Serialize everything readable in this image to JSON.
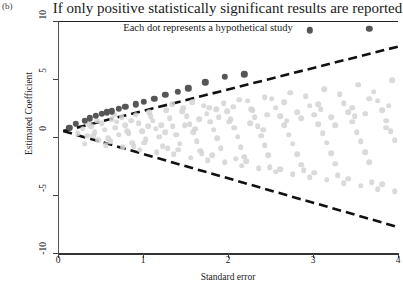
{
  "panel": {
    "label": "(b)"
  },
  "title": "If only positive statistically significant results are reported",
  "annotation": "Each dot represents a hypothetical study",
  "colors": {
    "reported_dot": "#565656",
    "unreported_dot": "#d4d4d4",
    "funnel_line": "#111111",
    "axis": "#333333",
    "background": "#ffffff"
  },
  "chart_data": {
    "type": "scatter",
    "title": "If only positive statistically significant results are reported",
    "subtitle": "Each dot represents a hypothetical study",
    "xlabel": "Standard error",
    "ylabel": "Estimated Coefficient",
    "xlim": [
      0,
      4
    ],
    "ylim": [
      -10,
      10
    ],
    "xticks": [
      0,
      1,
      2,
      3,
      4
    ],
    "yticks": [
      10,
      5,
      0,
      -5,
      -10
    ],
    "xticklabels": [
      "0",
      "1",
      "2",
      "3",
      "4"
    ],
    "yticklabels": [
      "10",
      "5",
      "0",
      "-5",
      "-10"
    ],
    "grid": false,
    "legend": "none",
    "annotations": [
      {
        "text": "Each dot represents a hypothetical study",
        "x": 1.55,
        "y": 9.4
      }
    ],
    "funnel_lines": [
      {
        "name": "upper significance boundary",
        "style": "dashed",
        "x": [
          0.05,
          4.0
        ],
        "y": [
          0.6,
          7.9
        ]
      },
      {
        "name": "lower significance boundary",
        "style": "dashed",
        "x": [
          0.05,
          4.0
        ],
        "y": [
          0.6,
          -7.7
        ]
      }
    ],
    "series": [
      {
        "name": "Reported studies (positive and statistically significant)",
        "color": "#565656",
        "marker": "circle",
        "points": [
          [
            0.12,
            0.9
          ],
          [
            0.2,
            1.2
          ],
          [
            0.3,
            1.5
          ],
          [
            0.36,
            1.7
          ],
          [
            0.43,
            1.9
          ],
          [
            0.5,
            2.1
          ],
          [
            0.56,
            2.2
          ],
          [
            0.62,
            2.3
          ],
          [
            0.7,
            2.5
          ],
          [
            0.78,
            2.7
          ],
          [
            0.9,
            2.9
          ],
          [
            1.0,
            3.1
          ],
          [
            1.12,
            3.4
          ],
          [
            1.25,
            3.7
          ],
          [
            1.4,
            4.0
          ],
          [
            1.52,
            4.3
          ],
          [
            1.72,
            4.8
          ],
          [
            1.95,
            5.3
          ],
          [
            2.18,
            5.5
          ],
          [
            2.95,
            9.3
          ],
          [
            3.65,
            9.4
          ]
        ]
      },
      {
        "name": "Unreported studies (null or negative results)",
        "color": "#d4d4d4",
        "marker": "circle",
        "points": [
          [
            0.22,
            0.4
          ],
          [
            0.28,
            0.8
          ],
          [
            0.33,
            0.2
          ],
          [
            0.38,
            1.0
          ],
          [
            0.42,
            0.5
          ],
          [
            0.46,
            -0.2
          ],
          [
            0.5,
            1.3
          ],
          [
            0.54,
            0.7
          ],
          [
            0.58,
            0.0
          ],
          [
            0.62,
            1.6
          ],
          [
            0.66,
            0.9
          ],
          [
            0.7,
            0.3
          ],
          [
            0.74,
            1.8
          ],
          [
            0.78,
            1.1
          ],
          [
            0.82,
            0.4
          ],
          [
            0.86,
            -0.4
          ],
          [
            0.9,
            2.0
          ],
          [
            0.94,
            1.3
          ],
          [
            0.98,
            0.6
          ],
          [
            1.02,
            -0.1
          ],
          [
            1.06,
            2.2
          ],
          [
            1.1,
            1.5
          ],
          [
            1.14,
            0.8
          ],
          [
            1.18,
            0.1
          ],
          [
            1.22,
            -0.7
          ],
          [
            1.26,
            2.4
          ],
          [
            1.3,
            1.7
          ],
          [
            1.34,
            1.0
          ],
          [
            1.38,
            0.3
          ],
          [
            1.42,
            -0.5
          ],
          [
            1.46,
            2.6
          ],
          [
            1.5,
            1.9
          ],
          [
            1.54,
            1.2
          ],
          [
            1.58,
            0.5
          ],
          [
            1.62,
            -0.3
          ],
          [
            1.66,
            -1.1
          ],
          [
            1.7,
            2.8
          ],
          [
            1.74,
            2.1
          ],
          [
            1.78,
            1.4
          ],
          [
            1.82,
            0.7
          ],
          [
            1.86,
            0.0
          ],
          [
            1.9,
            -0.9
          ],
          [
            1.94,
            3.0
          ],
          [
            1.98,
            2.3
          ],
          [
            2.02,
            1.6
          ],
          [
            2.06,
            0.9
          ],
          [
            2.1,
            0.1
          ],
          [
            2.14,
            -0.8
          ],
          [
            2.18,
            -1.6
          ],
          [
            2.22,
            3.2
          ],
          [
            2.26,
            2.5
          ],
          [
            2.3,
            1.8
          ],
          [
            2.34,
            1.0
          ],
          [
            2.38,
            0.2
          ],
          [
            2.42,
            -0.6
          ],
          [
            2.46,
            -1.5
          ],
          [
            2.5,
            3.4
          ],
          [
            2.55,
            2.6
          ],
          [
            2.6,
            1.9
          ],
          [
            2.65,
            1.1
          ],
          [
            2.7,
            0.3
          ],
          [
            2.75,
            -0.5
          ],
          [
            2.8,
            -1.4
          ],
          [
            2.85,
            -2.3
          ],
          [
            2.9,
            3.6
          ],
          [
            2.95,
            2.8
          ],
          [
            3.0,
            2.0
          ],
          [
            3.05,
            1.2
          ],
          [
            3.1,
            0.4
          ],
          [
            3.15,
            -0.4
          ],
          [
            3.2,
            -1.3
          ],
          [
            3.25,
            -2.2
          ],
          [
            3.3,
            3.8
          ],
          [
            3.35,
            3.0
          ],
          [
            3.4,
            2.2
          ],
          [
            3.45,
            1.4
          ],
          [
            3.5,
            0.5
          ],
          [
            3.55,
            -0.3
          ],
          [
            3.6,
            -1.2
          ],
          [
            3.65,
            -2.1
          ],
          [
            3.7,
            4.0
          ],
          [
            3.75,
            3.2
          ],
          [
            3.8,
            2.4
          ],
          [
            3.85,
            1.5
          ],
          [
            3.9,
            0.6
          ],
          [
            3.95,
            -0.2
          ],
          [
            0.45,
            1.5
          ],
          [
            0.55,
            -0.6
          ],
          [
            0.65,
            2.0
          ],
          [
            0.75,
            -0.8
          ],
          [
            0.85,
            1.5
          ],
          [
            0.95,
            -1.0
          ],
          [
            1.05,
            1.0
          ],
          [
            1.15,
            -1.2
          ],
          [
            1.25,
            0.5
          ],
          [
            1.35,
            -1.4
          ],
          [
            1.45,
            2.3
          ],
          [
            1.55,
            -1.7
          ],
          [
            1.65,
            1.6
          ],
          [
            1.75,
            -1.9
          ],
          [
            1.85,
            2.5
          ],
          [
            1.95,
            -2.1
          ],
          [
            2.05,
            2.7
          ],
          [
            2.15,
            -2.4
          ],
          [
            2.25,
            1.3
          ],
          [
            2.35,
            -2.6
          ],
          [
            2.45,
            2.0
          ],
          [
            2.55,
            -2.9
          ],
          [
            2.65,
            3.1
          ],
          [
            2.75,
            -3.1
          ],
          [
            2.85,
            1.7
          ],
          [
            2.95,
            -3.4
          ],
          [
            3.05,
            2.9
          ],
          [
            3.15,
            -3.6
          ],
          [
            3.25,
            1.1
          ],
          [
            3.35,
            -3.9
          ],
          [
            3.45,
            2.6
          ],
          [
            3.55,
            -4.1
          ],
          [
            3.65,
            3.4
          ],
          [
            3.75,
            -4.4
          ],
          [
            3.85,
            0.9
          ],
          [
            3.95,
            -4.6
          ],
          [
            0.3,
            -0.5
          ],
          [
            0.4,
            0.2
          ],
          [
            0.6,
            -0.3
          ],
          [
            0.8,
            0.6
          ],
          [
            1.0,
            -0.4
          ],
          [
            1.2,
            1.1
          ],
          [
            1.4,
            -1.0
          ],
          [
            1.6,
            0.8
          ],
          [
            1.8,
            -1.5
          ],
          [
            2.0,
            1.4
          ],
          [
            2.2,
            -2.0
          ],
          [
            2.4,
            0.7
          ],
          [
            2.6,
            -2.7
          ],
          [
            2.8,
            2.2
          ],
          [
            3.0,
            -3.0
          ],
          [
            3.2,
            1.8
          ],
          [
            3.4,
            -3.5
          ],
          [
            3.6,
            2.1
          ],
          [
            3.8,
            -4.0
          ],
          [
            0.35,
            1.2
          ],
          [
            0.68,
            1.4
          ],
          [
            0.88,
            -0.7
          ],
          [
            1.08,
            1.9
          ],
          [
            1.28,
            -0.9
          ],
          [
            1.48,
            1.1
          ],
          [
            1.68,
            -1.3
          ],
          [
            1.88,
            1.8
          ],
          [
            2.08,
            -1.8
          ],
          [
            2.28,
            2.4
          ],
          [
            2.48,
            -2.5
          ],
          [
            2.68,
            1.5
          ],
          [
            2.88,
            -2.8
          ],
          [
            3.08,
            2.5
          ],
          [
            3.28,
            -3.2
          ],
          [
            3.48,
            1.9
          ],
          [
            3.68,
            -3.8
          ],
          [
            3.88,
            2.8
          ],
          [
            1.33,
            2.9
          ],
          [
            1.57,
            3.1
          ],
          [
            2.12,
            3.3
          ],
          [
            2.72,
            3.9
          ],
          [
            3.12,
            4.2
          ],
          [
            3.52,
            4.6
          ],
          [
            3.92,
            5.0
          ],
          [
            2.42,
            3.5
          ],
          [
            1.77,
            2.6
          ]
        ]
      }
    ]
  }
}
